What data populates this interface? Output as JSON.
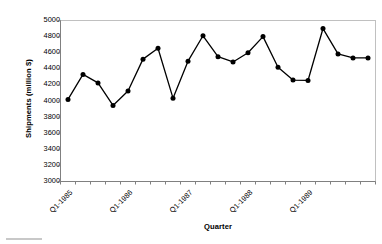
{
  "chart_data": {
    "type": "line",
    "title": "",
    "xlabel": "Quarter",
    "ylabel": "Shipments (million $)",
    "ylim": [
      3000,
      5000
    ],
    "ytick_step": 200,
    "yticks": [
      5000,
      4800,
      4600,
      4400,
      4200,
      4000,
      3800,
      3600,
      3400,
      3200,
      3000
    ],
    "grid": false,
    "legend": "none",
    "marker": "filled-circle",
    "line_color": "#000000",
    "marker_color": "#000000",
    "axis_color": "#808080",
    "plot_border_color": "#c0c0c0",
    "x_tick_count": 21,
    "x_labels_every": 4,
    "categories": [
      "Q1-1985",
      "Q2-1985",
      "Q3-1985",
      "Q4-1985",
      "Q1-1986",
      "Q2-1986",
      "Q3-1986",
      "Q4-1986",
      "Q1-1987",
      "Q2-1987",
      "Q3-1987",
      "Q4-1987",
      "Q1-1988",
      "Q2-1988",
      "Q3-1988",
      "Q4-1988",
      "Q1-1989",
      "Q2-1989",
      "Q3-1989",
      "Q4-1989",
      "Q1-1990"
    ],
    "xtick_labels_shown": [
      "Q1-1985",
      "Q1-1986",
      "Q1-1987",
      "Q1-1988",
      "Q1-1989"
    ],
    "values": [
      4020,
      4330,
      4225,
      3945,
      4125,
      4520,
      4655,
      4035,
      4495,
      4810,
      4550,
      4485,
      4600,
      4800,
      4420,
      4260,
      4255,
      4900,
      4585,
      4535,
      4535
    ]
  }
}
